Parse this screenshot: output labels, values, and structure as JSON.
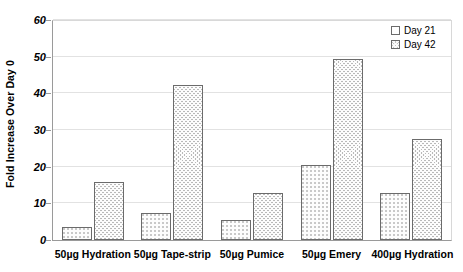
{
  "chart_data": {
    "type": "bar",
    "title": "",
    "xlabel": "",
    "ylabel": "Fold Increase Over Day 0",
    "ylim": [
      0,
      60
    ],
    "yticks": [
      0,
      10,
      20,
      30,
      40,
      50,
      60
    ],
    "grid": true,
    "legend_position": "top-right",
    "categories": [
      "50µg  Hydration",
      "50µg Tape-strip",
      "50µg  Pumice",
      "50µg  Emery",
      "400µg Hydration"
    ],
    "series": [
      {
        "name": "Day 21",
        "values": [
          3.5,
          7.4,
          5.5,
          20.4,
          12.8
        ]
      },
      {
        "name": "Day 42",
        "values": [
          15.8,
          42.2,
          12.8,
          49.3,
          27.5
        ]
      }
    ]
  },
  "legend": {
    "items": [
      {
        "label": "Day 21"
      },
      {
        "label": "Day 42"
      }
    ]
  }
}
